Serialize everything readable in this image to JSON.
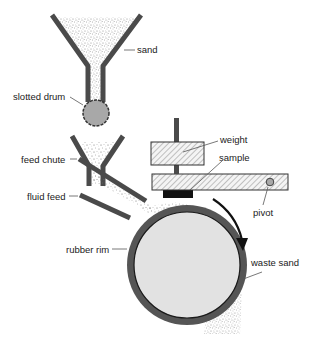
{
  "diagram": {
    "type": "schematic",
    "colors": {
      "structure": "#4a4a4a",
      "sand": "#9a9a9a",
      "drum_fill": "#a8a8a8",
      "wheel_fill": "#e2e2e2",
      "rim": "#555555",
      "sample": "#111111",
      "hatch": "#888888"
    },
    "labels": {
      "sand": "sand",
      "slotted_drum": "slotted drum",
      "feed_chute": "feed chute",
      "fluid_feed": "fluid feed",
      "rubber_rim": "rubber rim",
      "weight": "weight",
      "sample": "sample",
      "pivot": "pivot",
      "waste_sand": "waste sand"
    },
    "rotation_direction": "clockwise"
  }
}
